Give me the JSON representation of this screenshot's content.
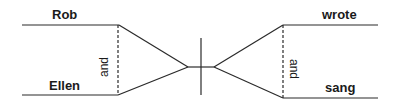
{
  "diagram": {
    "type": "sentence-diagram",
    "subjects": [
      "Rob",
      "Ellen"
    ],
    "subject_conjunction": "and",
    "verbs": [
      "wrote",
      "sang"
    ],
    "verb_conjunction": "and",
    "line_color": "#2a2a2a"
  }
}
